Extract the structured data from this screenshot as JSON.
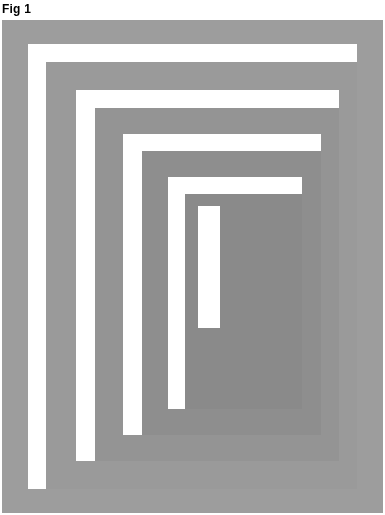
{
  "figure": {
    "label": "Fig 1",
    "caption_position": "top-left",
    "plate": {
      "x": 2,
      "y": 20,
      "width": 381,
      "height": 493,
      "medium": "halftoned scan on graph paper",
      "grid": {
        "minor_spacing_px": 3,
        "major_spacing_px": 15,
        "decade_spacing_px": 75,
        "minor_color": "#282828",
        "major_color": "#0f0f0f",
        "visible": true
      }
    }
  },
  "chart_data": {
    "type": "heatmap",
    "title": "Fig 1",
    "subtitle": "",
    "xlabel": "",
    "ylabel": "",
    "grid": true,
    "legend_position": "none",
    "background": "#ffffff",
    "rings": [
      {
        "name": "ring-1-outer-gray",
        "left": 0,
        "top": 0,
        "width": 381,
        "height": 493,
        "fill": "#9d9d9d",
        "tone": 0.38
      },
      {
        "name": "ring-2-white",
        "left": 26,
        "top": 24,
        "width": 329,
        "height": 445,
        "fill": "#ffffff",
        "tone": 0.0
      },
      {
        "name": "ring-3-gray",
        "left": 44,
        "top": 42,
        "width": 311,
        "height": 427,
        "fill": "#9a9a9a",
        "tone": 0.4
      },
      {
        "name": "ring-4-white",
        "left": 74,
        "top": 70,
        "width": 263,
        "height": 371,
        "fill": "#ffffff",
        "tone": 0.0
      },
      {
        "name": "ring-5-gray",
        "left": 93,
        "top": 88,
        "width": 244,
        "height": 353,
        "fill": "#949494",
        "tone": 0.43
      },
      {
        "name": "ring-6-white",
        "left": 121,
        "top": 114,
        "width": 198,
        "height": 301,
        "fill": "#ffffff",
        "tone": 0.0
      },
      {
        "name": "ring-7-gray",
        "left": 140,
        "top": 131,
        "width": 179,
        "height": 284,
        "fill": "#8e8e8e",
        "tone": 0.46
      },
      {
        "name": "ring-8-white",
        "left": 166,
        "top": 157,
        "width": 134,
        "height": 232,
        "fill": "#ffffff",
        "tone": 0.0
      },
      {
        "name": "ring-9-gray",
        "left": 183,
        "top": 174,
        "width": 117,
        "height": 215,
        "fill": "#8a8a8a",
        "tone": 0.48
      },
      {
        "name": "ring-10-white",
        "left": 196,
        "top": 186,
        "width": 22,
        "height": 122,
        "fill": "#ffffff",
        "tone": 0.0
      }
    ],
    "x": [
      0,
      381
    ],
    "values": [
      0.38,
      0.0,
      0.4,
      0.0,
      0.43,
      0.0,
      0.46,
      0.0,
      0.48,
      0.0
    ],
    "categories": [
      "ring-1-outer-gray",
      "ring-2-white",
      "ring-3-gray",
      "ring-4-white",
      "ring-5-gray",
      "ring-6-white",
      "ring-7-gray",
      "ring-8-white",
      "ring-9-gray",
      "ring-10-white"
    ],
    "xlim": [
      0,
      381
    ],
    "ylim": [
      0,
      493
    ]
  },
  "colors": {
    "paper": "#ffffff",
    "ink": "#000000",
    "gray_light": "#b0b0b0",
    "gray_mid": "#9a9a9a",
    "gray_dark": "#888888",
    "grid_line": "#282828"
  }
}
